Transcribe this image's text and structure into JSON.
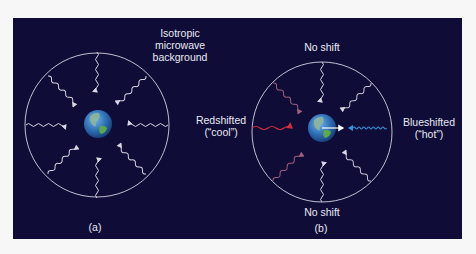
{
  "figure": {
    "background_color": "#0f0d38",
    "page_color": "#f7f7f8",
    "panels": [
      {
        "id": "a",
        "caption": "(a)",
        "title_line1": "Isotropic",
        "title_line2": "microwave",
        "title_line3": "background",
        "wave_color": "#d9d6e4"
      },
      {
        "id": "b",
        "caption": "(b)",
        "top_label": "No shift",
        "bottom_label": "No shift",
        "left_label_line1": "Redshifted",
        "left_label_line2": "(“cool”)",
        "right_label_line1": "Blueshifted",
        "right_label_line2": "(“hot”)",
        "redshift_color": "#d0303a",
        "blueshift_color": "#3a8fd8",
        "diagonal_left_color": "#a0607e",
        "diagonal_right_color": "#c8c4d8",
        "motion_arrow_color": "#ffffff"
      }
    ]
  }
}
